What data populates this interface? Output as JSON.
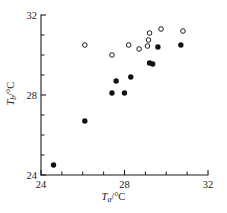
{
  "chart_data": {
    "type": "scatter",
    "title": "",
    "xlabel": "T_a /°C",
    "ylabel": "T_b /°C",
    "xlabel_parts": {
      "var": "T",
      "sub": "a",
      "unit": "/°C"
    },
    "ylabel_parts": {
      "var": "T",
      "sub": "b",
      "unit": "/°C"
    },
    "xlim": [
      24,
      32
    ],
    "ylim": [
      24,
      32
    ],
    "grid": false,
    "legend": "none",
    "x_major_ticks": [
      24,
      28,
      32
    ],
    "x_minor_ticks": [
      25,
      26,
      27,
      29,
      30,
      31
    ],
    "y_major_ticks": [
      24,
      28,
      32
    ],
    "y_minor_ticks": [
      25,
      26,
      27,
      29,
      30,
      31
    ],
    "x_tick_labels": [
      "24",
      "28",
      "32"
    ],
    "y_tick_labels": [
      "24",
      "28",
      "32"
    ],
    "series": [
      {
        "name": "filled",
        "marker": "filled-circle",
        "color": "#111111",
        "points": [
          [
            24.6,
            24.5
          ],
          [
            26.1,
            26.7
          ],
          [
            27.4,
            28.1
          ],
          [
            28.0,
            28.1
          ],
          [
            27.6,
            28.7
          ],
          [
            28.3,
            28.9
          ],
          [
            29.2,
            29.6
          ],
          [
            29.35,
            29.55
          ],
          [
            29.6,
            30.4
          ],
          [
            30.7,
            30.5
          ]
        ]
      },
      {
        "name": "open",
        "marker": "open-circle",
        "color": "#1a1a1a",
        "points": [
          [
            26.1,
            30.5
          ],
          [
            27.4,
            30.0
          ],
          [
            28.2,
            30.5
          ],
          [
            28.7,
            30.3
          ],
          [
            29.15,
            30.75
          ],
          [
            29.2,
            31.1
          ],
          [
            29.1,
            30.45
          ],
          [
            29.75,
            31.3
          ],
          [
            30.8,
            31.2
          ]
        ]
      }
    ]
  },
  "axes": {
    "x_axis_name": "x-axis",
    "y_axis_name": "y-axis"
  }
}
